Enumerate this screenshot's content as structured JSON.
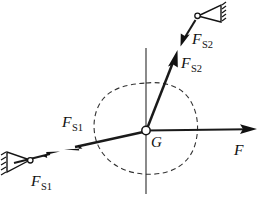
{
  "figure": {
    "type": "free-body-diagram",
    "title": "",
    "background_color": "#ffffff",
    "line_color": "#1a1a1a",
    "outline_color": "#333333",
    "width": 261,
    "height": 197
  },
  "center": {
    "label": "G",
    "meaning": "center-of-gravity",
    "x": 146,
    "y": 131
  },
  "axes": {
    "vertical": {
      "x": 146,
      "y_top": 48,
      "y_bottom": 194
    },
    "horizontal_visible": true
  },
  "body": {
    "name": "rigid-body-outline",
    "style": "dashed",
    "shape": "irregular-closed-blob"
  },
  "vectors": [
    {
      "id": "F",
      "label": "F",
      "subscript": "",
      "label_x": 236,
      "label_y": 152,
      "from": {
        "x": 146,
        "y": 131
      },
      "to": {
        "x": 255,
        "y": 129
      },
      "direction": "right",
      "has_support": false,
      "description": "applied force F pointing right from G"
    },
    {
      "id": "F_S2_inner",
      "label": "F",
      "subscript": "S2",
      "label_x": 181,
      "label_y": 69,
      "from": {
        "x": 146,
        "y": 131
      },
      "to": {
        "x": 176,
        "y": 53
      },
      "direction": "up-right",
      "has_support": false,
      "description": "reaction force F_S2 pointing up-right from G"
    },
    {
      "id": "F_S2_outer",
      "label": "F",
      "subscript": "S2",
      "label_x": 196,
      "label_y": 43,
      "from": {
        "x": 197,
        "y": 18
      },
      "to": {
        "x": 181,
        "y": 44
      },
      "direction": "down-left",
      "has_support": true,
      "support_x": 198,
      "support_y": 16,
      "description": "force F_S2 at upper-right support pointing down-left"
    },
    {
      "id": "F_S1_inner",
      "label": "F",
      "subscript": "S1",
      "label_x": 78,
      "label_y": 125,
      "from": {
        "x": 146,
        "y": 131
      },
      "to": {
        "x": 66,
        "y": 149
      },
      "direction": "down-left",
      "has_support": false,
      "description": "reaction force F_S1 pointing down-left from G"
    },
    {
      "id": "F_S1_outer",
      "label": "F",
      "subscript": "S1",
      "label_x": 34,
      "label_y": 184,
      "from": {
        "x": 12,
        "y": 162
      },
      "to": {
        "x": 56,
        "y": 152
      },
      "direction": "up-right",
      "has_support": true,
      "support_x": 11,
      "support_y": 163,
      "description": "force F_S1 at lower-left support pointing up-right"
    }
  ],
  "supports": [
    {
      "id": "support-upper-right",
      "type": "pin-support-triangle",
      "x": 198,
      "y": 16
    },
    {
      "id": "support-lower-left",
      "type": "pin-support-triangle",
      "x": 11,
      "y": 163
    }
  ]
}
